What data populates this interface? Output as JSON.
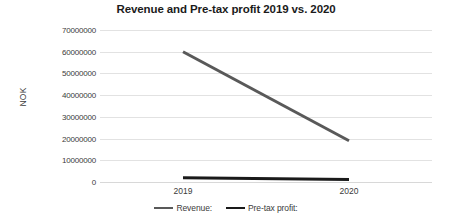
{
  "chart_data": {
    "type": "line",
    "title": "Revenue and Pre-tax profit 2019 vs. 2020",
    "xlabel": "",
    "ylabel": "NOK",
    "categories": [
      "2019",
      "2020"
    ],
    "series": [
      {
        "name": "Revenue:",
        "values": [
          60000000,
          19000000
        ],
        "color": "#595959"
      },
      {
        "name": "Pre-tax profit:",
        "values": [
          2000000,
          1200000
        ],
        "color": "#1a1a1a"
      }
    ],
    "ylim": [
      0,
      70000000
    ],
    "yticks": [
      "70000000",
      "60000000",
      "50000000",
      "40000000",
      "30000000",
      "20000000",
      "10000000",
      "0"
    ],
    "ytick_values": [
      70000000,
      60000000,
      50000000,
      40000000,
      30000000,
      20000000,
      10000000,
      0
    ],
    "grid": true,
    "legend_position": "bottom",
    "gridline_color": "#e2e2e2",
    "title_color": "#1b1b1b",
    "axis_text_color": "#3b3b3b"
  }
}
